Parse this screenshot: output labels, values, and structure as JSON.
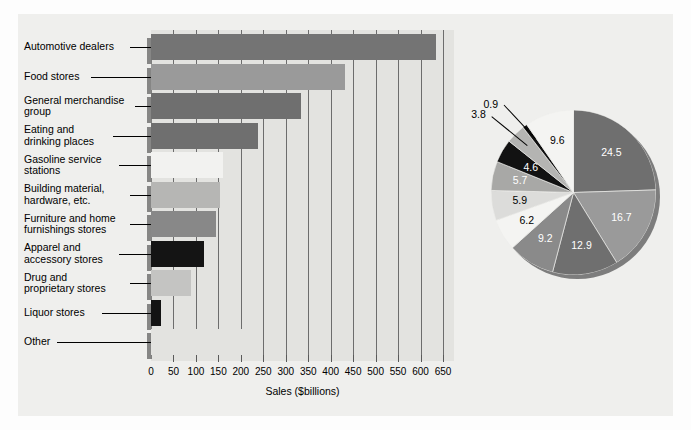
{
  "chart_data": [
    {
      "type": "bar",
      "orientation": "horizontal",
      "title": "",
      "xlabel": "Sales ($billions)",
      "ylabel": "",
      "xlim": [
        0,
        650
      ],
      "xticks": [
        0,
        50,
        100,
        150,
        200,
        250,
        300,
        350,
        400,
        450,
        500,
        550,
        600,
        650
      ],
      "xtick_labels": [
        "0",
        "50",
        "100",
        "150",
        "200",
        "250",
        "300",
        "350",
        "400",
        "450",
        "500",
        "550",
        "600",
        "650"
      ],
      "grid": true,
      "categories": [
        "Automotive dealers",
        "Food stores",
        "General merchandise\ngroup",
        "Eating and\ndrinking places",
        "Gasoline service\nstations",
        "Building material,\nhardware, etc.",
        "Furniture and home\nfurnishings stores",
        "Apparel and\naccessory stores",
        "Drug and\nproprietary stores",
        "Liquor stores",
        "Other"
      ],
      "values": [
        634,
        432,
        334,
        238,
        160,
        153,
        144,
        119,
        88,
        23,
        248
      ],
      "colors": [
        "#747474",
        "#9a9a9a",
        "#6f6f6f",
        "#6f6f6f",
        "#f2f2f0",
        "#b6b6b4",
        "#888888",
        "#141414",
        "#c4c4c2",
        "#131313",
        "#e3e3e0"
      ]
    },
    {
      "type": "pie",
      "title": "",
      "labels": [
        "Automotive dealers",
        "Food stores",
        "General merchandise group",
        "Eating and drinking places",
        "Gasoline service stations",
        "Building material, hardware, etc.",
        "Furniture and home furnishings stores",
        "Apparel and accessory stores",
        "Drug and proprietary stores",
        "Liquor stores",
        "Other"
      ],
      "values": [
        24.5,
        16.7,
        12.9,
        9.2,
        6.2,
        5.9,
        5.7,
        4.6,
        3.8,
        0.9,
        9.6
      ],
      "data_labels": [
        "24.5",
        "16.7",
        "12.9",
        "9.2",
        "6.2",
        "5.9",
        "5.7",
        "4.6",
        "3.8",
        "0.9",
        "9.6"
      ],
      "units": "percent",
      "colors": [
        "#6f6f6f",
        "#9a9a9a",
        "#6f6f6f",
        "#8a8a8a",
        "#f4f4f2",
        "#dcdcda",
        "#a8a8a6",
        "#121212",
        "#b4b4b2",
        "#111111",
        "#f4f4f2"
      ],
      "label_colors": [
        "#ffffff",
        "#ffffff",
        "#ffffff",
        "#ffffff",
        "#000000",
        "#000000",
        "#ffffff",
        "#ffffff",
        "#000000",
        "#000000",
        "#000000"
      ],
      "startangle": 90,
      "direction": "clockwise"
    }
  ],
  "bars": [
    {
      "label": "Automotive dealers",
      "value": 634
    },
    {
      "label": "Food stores",
      "value": 432
    },
    {
      "label": "General merchandise\ngroup",
      "value": 334
    },
    {
      "label": "Eating and\ndrinking places",
      "value": 238
    },
    {
      "label": "Gasoline service\nstations",
      "value": 160
    },
    {
      "label": "Building material,\nhardware, etc.",
      "value": 153
    },
    {
      "label": "Furniture and home\nfurnishings stores",
      "value": 144
    },
    {
      "label": "Apparel and\naccessory stores",
      "value": 119
    },
    {
      "label": "Drug and\nproprietary stores",
      "value": 88
    },
    {
      "label": "Liquor stores",
      "value": 23
    },
    {
      "label": "Other",
      "value": 248
    }
  ],
  "axis": {
    "title": "Sales ($billions)",
    "ticks": [
      "0",
      "50",
      "100",
      "150",
      "200",
      "250",
      "300",
      "350",
      "400",
      "450",
      "500",
      "550",
      "600",
      "650"
    ]
  },
  "pie_labels": {
    "s0": "24.5",
    "s1": "16.7",
    "s2": "12.9",
    "s3": "9.2",
    "s4": "6.2",
    "s5": "5.9",
    "s6": "5.7",
    "s7": "4.6",
    "s8": "3.8",
    "s9": "0.9",
    "s10": "9.6"
  }
}
